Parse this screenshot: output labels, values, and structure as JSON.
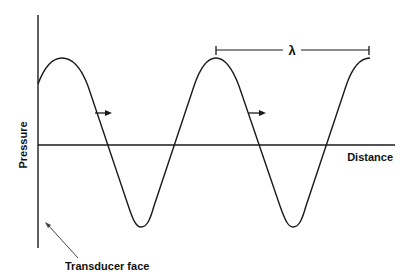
{
  "diagram": {
    "title": "",
    "y_axis_label": "Pressure",
    "x_axis_label": "Distance",
    "wavelength_symbol": "λ",
    "annotation": "Transducer face",
    "colors": {
      "line": "#1a1a1a",
      "annotation_arrow": "#444444",
      "background": "#ffffff"
    },
    "wave": {
      "type": "sinusoidal pressure wave",
      "peaks_x": [
        62,
        216,
        370
      ],
      "troughs_x": [
        140,
        293
      ],
      "peak_y": 58,
      "trough_y": 227,
      "baseline_y": 145
    },
    "direction_arrows": 2
  }
}
